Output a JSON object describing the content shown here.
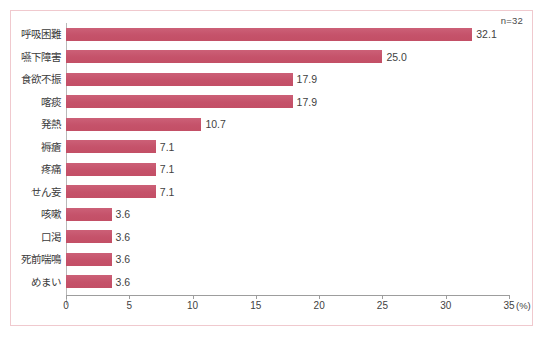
{
  "chart_data": {
    "type": "bar",
    "orientation": "horizontal",
    "title": "",
    "subtitle": "",
    "xlabel": "(%)",
    "ylabel": "",
    "annotation": "n=32",
    "categories": [
      "呼吸困難",
      "嚥下障害",
      "食欲不振",
      "喀痰",
      "発熱",
      "褥瘡",
      "疼痛",
      "せん妄",
      "咳嗽",
      "口渇",
      "死前喘鳴",
      "めまい"
    ],
    "values": [
      32.1,
      25.0,
      17.9,
      17.9,
      10.7,
      7.1,
      7.1,
      7.1,
      3.6,
      3.6,
      3.6,
      3.6
    ],
    "value_labels": [
      "32.1",
      "25.0",
      "17.9",
      "17.9",
      "10.7",
      "7.1",
      "7.1",
      "7.1",
      "3.6",
      "3.6",
      "3.6",
      "3.6"
    ],
    "xlim": [
      0,
      35
    ],
    "xticks": [
      0,
      5,
      10,
      15,
      20,
      25,
      30,
      35
    ],
    "xtick_labels": [
      "0",
      "5",
      "10",
      "15",
      "20",
      "25",
      "30",
      "35"
    ],
    "grid": false,
    "legend": false,
    "bar_color": "#c8566e",
    "text_color": "#3f3f3f",
    "frame_color": "#f0c9ce",
    "axis_color": "#9d9d9d"
  }
}
